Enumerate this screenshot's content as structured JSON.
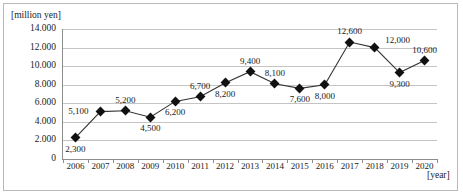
{
  "chart_data": {
    "type": "line",
    "title": "",
    "xlabel": "[year]",
    "ylabel": "[million yen]",
    "ylim": [
      0,
      14000
    ],
    "ytick_values": [
      0,
      2000,
      4000,
      6000,
      8000,
      10000,
      12000,
      14000
    ],
    "ytick_labels": [
      "0",
      "2.000",
      "4.000",
      "6.000",
      "8.000",
      "10.000",
      "12.000",
      "14.000"
    ],
    "grid": true,
    "legend": "none",
    "categories": [
      "2006",
      "2007",
      "2008",
      "2009",
      "2010",
      "2011",
      "2012",
      "2013",
      "2014",
      "2015",
      "2016",
      "2017",
      "2018",
      "2019",
      "2020"
    ],
    "values": [
      2300,
      5100,
      5200,
      4500,
      6200,
      6700,
      8200,
      9400,
      8100,
      7600,
      8000,
      12600,
      12000,
      9300,
      10600
    ],
    "point_labels": [
      "2,300",
      "5,100",
      "5,200",
      "4,500",
      "6,200",
      "6,700",
      "8,200",
      "9,400",
      "8,100",
      "7,600",
      "8,000",
      "12,600",
      "12,000",
      "9,300",
      "10,600"
    ],
    "label_positions": [
      "below",
      "left",
      "above",
      "below",
      "below",
      "above",
      "below",
      "above",
      "above",
      "below",
      "below",
      "above",
      "right",
      "below",
      "above"
    ],
    "series_color": "#333333",
    "marker": "diamond",
    "marker_color": "#111111",
    "grid_color": "#c4c4c4",
    "axis_color": "#8d8d8d"
  }
}
